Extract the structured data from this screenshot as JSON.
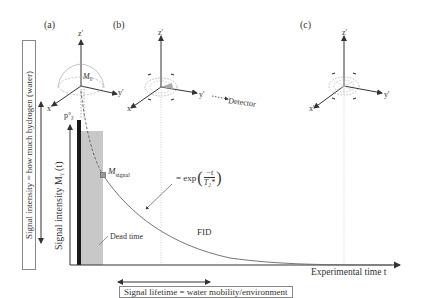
{
  "panels": {
    "a": {
      "label": "(a)",
      "axes": {
        "z": "z'",
        "y": "y'",
        "x": "x'"
      },
      "vector": "M₀"
    },
    "b": {
      "label": "(b)",
      "axes": {
        "z": "z'",
        "y": "y'",
        "x": "x'"
      },
      "detector": "Detector"
    },
    "c": {
      "label": "(c)",
      "axes": {
        "z": "z'",
        "y": "y'",
        "x": "x'"
      }
    }
  },
  "plot": {
    "ylabel": "Signal intensity Mᵧ (t)",
    "xlabel": "Experimental time t",
    "pulse_label": "p°ᵪ",
    "dead_time_label": "Dead time",
    "msignal_label": "M",
    "msignal_sub": "signal",
    "equation": "= exp(−t / T₂*)",
    "eq_prefix": "= exp",
    "eq_num": "−t",
    "eq_den": "T₂*",
    "fid_label": "FID"
  },
  "annotations": {
    "signal_intensity_box": "Signal intensity = how much hydrogen (water)",
    "signal_lifetime_box": "Signal lifetime = water mobility/environment"
  },
  "colors": {
    "axis": "#333333",
    "dead_time_fill": "#c8c8c8",
    "pulse_bar": "#1a1a1a",
    "curve": "#666666",
    "marker": "#777777"
  }
}
